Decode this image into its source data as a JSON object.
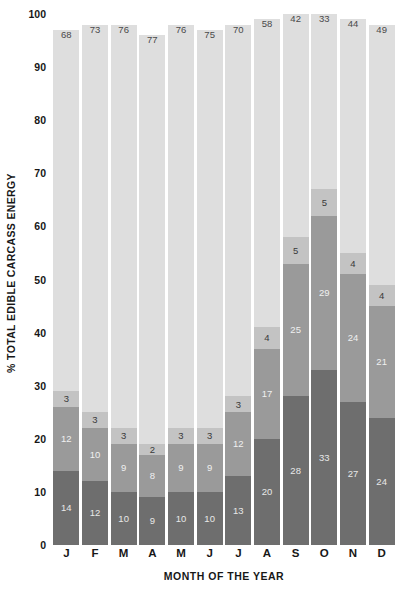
{
  "chart_data": {
    "type": "bar",
    "stacked": true,
    "title": "",
    "xlabel": "MONTH OF THE YEAR",
    "ylabel": "% TOTAL EDIBLE CARCASS ENERGY",
    "ylim": [
      0,
      100
    ],
    "yticks": [
      0,
      10,
      20,
      30,
      40,
      50,
      60,
      70,
      80,
      90,
      100
    ],
    "ytick_labels": [
      "0",
      "10",
      "20",
      "30",
      "40",
      "50",
      "60",
      "70",
      "80",
      "90",
      "100"
    ],
    "grid": false,
    "legend": "none",
    "categories": [
      "J",
      "F",
      "M",
      "A",
      "M",
      "J",
      "J",
      "A",
      "S",
      "O",
      "N",
      "D"
    ],
    "series": [
      {
        "name": "segment-1",
        "color": "#6e6e6e",
        "values": [
          14,
          12,
          10,
          9,
          10,
          10,
          13,
          20,
          28,
          33,
          27,
          24
        ]
      },
      {
        "name": "segment-2",
        "color": "#9a9a9a",
        "values": [
          12,
          10,
          9,
          8,
          9,
          9,
          12,
          17,
          25,
          29,
          24,
          21
        ]
      },
      {
        "name": "segment-3",
        "color": "#c3c3c3",
        "values": [
          3,
          3,
          3,
          2,
          3,
          3,
          3,
          4,
          5,
          5,
          4,
          4
        ]
      },
      {
        "name": "segment-4",
        "color": "#dedede",
        "values": [
          68,
          73,
          76,
          77,
          76,
          75,
          70,
          58,
          42,
          33,
          44,
          49
        ]
      }
    ],
    "totals": [
      97,
      98,
      98,
      96,
      98,
      97,
      98,
      99,
      100,
      100,
      99,
      98
    ]
  }
}
